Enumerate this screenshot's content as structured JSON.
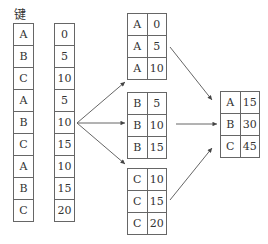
{
  "key_label": "键",
  "keys": [
    "A",
    "B",
    "C",
    "A",
    "B",
    "C",
    "A",
    "B",
    "C"
  ],
  "values": [
    "0",
    "5",
    "10",
    "5",
    "10",
    "15",
    "10",
    "15",
    "20"
  ],
  "groups": [
    {
      "rows": [
        [
          "A",
          "0"
        ],
        [
          "A",
          "5"
        ],
        [
          "A",
          "10"
        ]
      ]
    },
    {
      "rows": [
        [
          "B",
          "5"
        ],
        [
          "B",
          "10"
        ],
        [
          "B",
          "15"
        ]
      ]
    },
    {
      "rows": [
        [
          "C",
          "10"
        ],
        [
          "C",
          "15"
        ],
        [
          "C",
          "20"
        ]
      ]
    }
  ],
  "result": {
    "rows": [
      [
        "A",
        "15"
      ],
      [
        "B",
        "30"
      ],
      [
        "C",
        "45"
      ]
    ]
  },
  "colors": {
    "line": "#666666",
    "text": "#333333"
  }
}
